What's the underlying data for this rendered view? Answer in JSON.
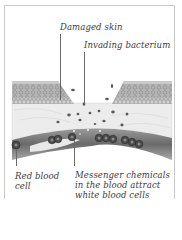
{
  "diagram": {
    "labels": {
      "damaged_skin": "Damaged skin",
      "invading_bacterium": "Invading bacterium",
      "red_blood_cell": {
        "line1": "Red blood",
        "line2": "cell"
      },
      "messenger_chemicals": {
        "line1": "Messenger chemicals",
        "line2": "in the blood attract",
        "line3": "white blood cells"
      }
    },
    "colors": {
      "frame": "#c8c8c8",
      "epidermis": "#a9a9a9",
      "epidermis_cells": "#8a8a8a",
      "dermis": "#ececec",
      "vessel_wall": "#5a5a5a",
      "blood_cell": "#3c3c3c",
      "label_text": "#3a3a3a"
    }
  }
}
